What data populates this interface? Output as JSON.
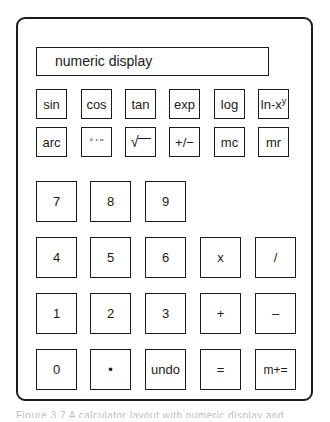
{
  "display": {
    "label": "numeric display"
  },
  "function_keys": {
    "row1": [
      {
        "label": "sin",
        "name": "sin"
      },
      {
        "label": "cos",
        "name": "cos"
      },
      {
        "label": "tan",
        "name": "tan"
      },
      {
        "label": "exp",
        "name": "exp"
      },
      {
        "label": "log",
        "name": "log"
      },
      {
        "label": "ln-x",
        "sup": "y",
        "name": "ln-x-power-y"
      }
    ],
    "row2": [
      {
        "label": "arc",
        "name": "arc"
      },
      {
        "label": "° ' ''",
        "name": "degrees-minutes-seconds"
      },
      {
        "label": "√",
        "name": "square-root"
      },
      {
        "label": "+/−",
        "name": "plus-minus"
      },
      {
        "label": "mc",
        "name": "memory-clear"
      },
      {
        "label": "mr",
        "name": "memory-recall"
      }
    ]
  },
  "keypad": {
    "rows": [
      [
        {
          "label": "7",
          "name": "digit-7"
        },
        {
          "label": "8",
          "name": "digit-8"
        },
        {
          "label": "9",
          "name": "digit-9"
        }
      ],
      [
        {
          "label": "4",
          "name": "digit-4"
        },
        {
          "label": "5",
          "name": "digit-5"
        },
        {
          "label": "6",
          "name": "digit-6"
        },
        {
          "label": "x",
          "name": "multiply"
        },
        {
          "label": "/",
          "name": "divide"
        }
      ],
      [
        {
          "label": "1",
          "name": "digit-1"
        },
        {
          "label": "2",
          "name": "digit-2"
        },
        {
          "label": "3",
          "name": "digit-3"
        },
        {
          "label": "+",
          "name": "add"
        },
        {
          "label": "–",
          "name": "subtract"
        }
      ],
      [
        {
          "label": "0",
          "name": "digit-0"
        },
        {
          "label": "•",
          "name": "decimal-point"
        },
        {
          "label": "undo",
          "name": "undo"
        },
        {
          "label": "=",
          "name": "equals"
        },
        {
          "label": "m+=",
          "name": "memory-add-equals"
        }
      ]
    ]
  },
  "caption": {
    "text": "Figure 3.7  A calculator layout with numeric display and function keys"
  }
}
